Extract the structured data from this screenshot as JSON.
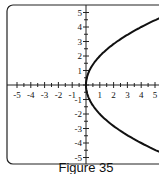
{
  "caption": "Figure 35",
  "chart_data": {
    "type": "line",
    "title": "",
    "equation": "x = y^2/4",
    "xlabel": "",
    "ylabel": "",
    "xlim": [
      -5,
      5
    ],
    "ylim": [
      -5,
      5
    ],
    "x_ticks": [
      "-5",
      "-4",
      "-3",
      "-2",
      "-1",
      "1",
      "2",
      "3",
      "4",
      "5"
    ],
    "y_ticks": [
      "5",
      "4",
      "3",
      "2",
      "1",
      "-1",
      "-2",
      "-3",
      "-4",
      "-5"
    ],
    "grid": false,
    "series": [
      {
        "name": "parabola",
        "points": [
          [
            5.06,
            -4.5
          ],
          [
            4,
            -4
          ],
          [
            2.25,
            -3
          ],
          [
            1,
            -2
          ],
          [
            0.25,
            -1
          ],
          [
            0,
            0
          ],
          [
            0.25,
            1
          ],
          [
            1,
            2
          ],
          [
            2.25,
            3
          ],
          [
            4,
            4
          ],
          [
            5.06,
            4.5
          ]
        ]
      }
    ]
  }
}
